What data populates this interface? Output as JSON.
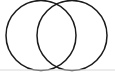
{
  "figure": {
    "type": "venn-diagram",
    "canvas": {
      "width": 115,
      "height": 73,
      "background_color": "#ffffff"
    },
    "style": {
      "stroke_color": "#1a1a1a",
      "stroke_width": 1.5,
      "fill": "none",
      "baseline_color": "#d8d8d8",
      "baseline_width": 1
    },
    "shapes": [
      {
        "name": "left-circle",
        "label": "",
        "center_x": 41,
        "center_y": 35.5,
        "radius": 35
      },
      {
        "name": "right-circle",
        "label": "",
        "center_x": 72,
        "center_y": 35.5,
        "radius": 35
      }
    ],
    "intersections": [
      {
        "name": "top-crossing",
        "x": 57,
        "y": 12
      },
      {
        "name": "bottom-crossing",
        "x": 57,
        "y": 60
      }
    ],
    "baseline": {
      "name": "bottom-rule",
      "x1": 0,
      "y1": 70,
      "x2": 115,
      "y2": 70
    },
    "labels": []
  },
  "chart_data": {
    "type": "venn",
    "title": "",
    "sets": [
      {
        "name": "A",
        "label": "",
        "center": [
          41,
          35.5
        ],
        "radius": 35
      },
      {
        "name": "B",
        "label": "",
        "center": [
          72,
          35.5
        ],
        "radius": 35
      }
    ],
    "regions": [
      {
        "name": "A-only",
        "label": ""
      },
      {
        "name": "A-and-B",
        "label": ""
      },
      {
        "name": "B-only",
        "label": ""
      }
    ],
    "legend": [],
    "annotations": [],
    "grid": false
  }
}
